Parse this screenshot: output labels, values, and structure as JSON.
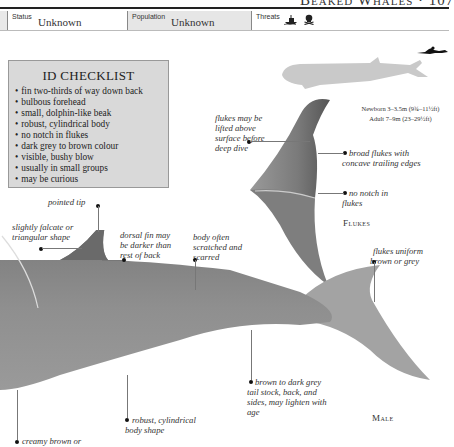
{
  "header": {
    "title": "Beaked Whales · 107"
  },
  "status_bar": {
    "status_label": "Status",
    "status_value": "Unknown",
    "population_label": "Population",
    "population_value": "Unknown",
    "threats_label": "Threats",
    "threat_icons": [
      "fishing-boat-icon",
      "skull-crossbones-icon"
    ]
  },
  "checklist": {
    "title": "ID CHECKLIST",
    "items": [
      "fin two-thirds of way down back",
      "bulbous forehead",
      "small, dolphin-like beak",
      "robust, cylindrical body",
      "no notch in flukes",
      "dark grey to brown colour",
      "visible, bushy blow",
      "usually in small groups",
      "may be curious"
    ]
  },
  "size": {
    "newborn": "Newborn 3–3.5m (9¾–11½ft)",
    "adult": "Adult 7–9m (23–29½ft)"
  },
  "flukes_annotations": {
    "lifted": "flukes may be lifted above surface before deep dive",
    "broad": "broad flukes with concave trailing edges",
    "no_notch": "no notch in flukes",
    "caption": "Flukes"
  },
  "body_annotations": {
    "pointed_tip": "pointed tip",
    "falcate": "slightly falcate or triangular shape",
    "dorsal_darker": "dorsal fin may be darker than rest of back",
    "scratched": "body often scratched and scarred",
    "flukes_uniform": "flukes uniform brown or grey",
    "tail_stock": "brown to dark grey tail stock, back, and sides, may lighten with age",
    "robust": "robust, cylindrical body shape",
    "creamy": "creamy brown or",
    "caption": "Male"
  },
  "colors": {
    "whale_body": "#8a8a8a",
    "silhouette": "#c9c9c9",
    "checklist_bg": "#d9d9d9"
  }
}
